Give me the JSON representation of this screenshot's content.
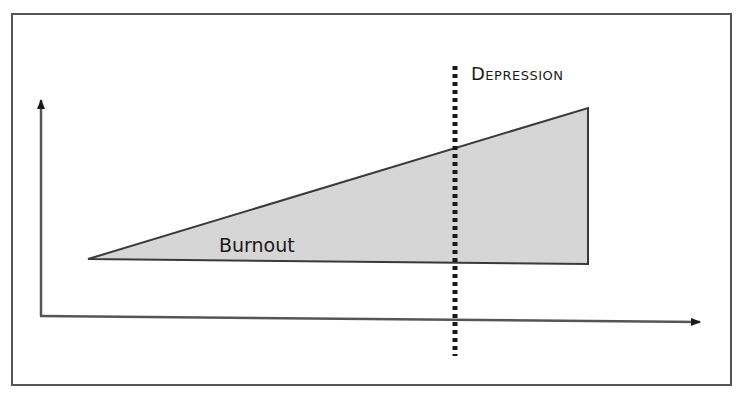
{
  "diagram": {
    "type": "conceptual-area-diagram",
    "labels": {
      "burnout": "Burnout",
      "depression": "Depression"
    },
    "colors": {
      "background": "#ffffff",
      "frame": "#555555",
      "area_fill": "#d6d6d6",
      "area_stroke": "#3a3a3a",
      "axis": "#555555",
      "threshold_line": "#1a1a1a",
      "text": "#1a1a1a"
    },
    "axes": {
      "x_label": "",
      "y_label": "",
      "x_arrow": true,
      "y_arrow": true
    },
    "area": {
      "shape": "wedge",
      "description": "Burnout grows from zero at left to maximum at right",
      "points": [
        [
          88,
          259
        ],
        [
          588,
          108
        ],
        [
          588,
          264
        ],
        [
          88,
          259
        ]
      ]
    },
    "threshold": {
      "style": "dotted-vertical",
      "x": 455,
      "label": "Depression"
    }
  }
}
